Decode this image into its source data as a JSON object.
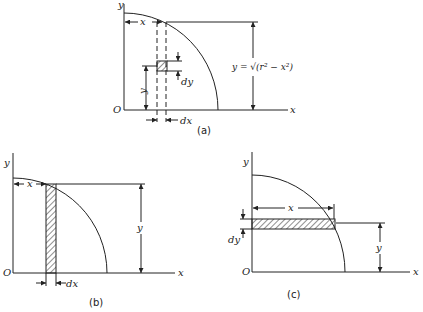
{
  "figure": {
    "panels": [
      {
        "id": "a",
        "caption": "(a)",
        "element": "differential square dx by dy",
        "labels": {
          "y_axis": "y",
          "x_axis": "x",
          "origin": "O",
          "x_dim": "x",
          "y_dim": "y",
          "dy": "dy",
          "dx": "dx",
          "curve_eq": "y = √(r² − x²)"
        }
      },
      {
        "id": "b",
        "caption": "(b)",
        "element": "vertical strip of width dx",
        "labels": {
          "y_axis": "y",
          "x_axis": "x",
          "origin": "O",
          "x_dim": "x",
          "y_dim": "y",
          "dx": "dx"
        }
      },
      {
        "id": "c",
        "caption": "(c)",
        "element": "horizontal strip of height dy",
        "labels": {
          "y_axis": "y",
          "x_axis": "x",
          "origin": "O",
          "x_dim": "x",
          "y_dim": "y",
          "dy": "dy"
        }
      }
    ],
    "colors": {
      "ink": "#222222",
      "background": "#ffffff"
    }
  }
}
